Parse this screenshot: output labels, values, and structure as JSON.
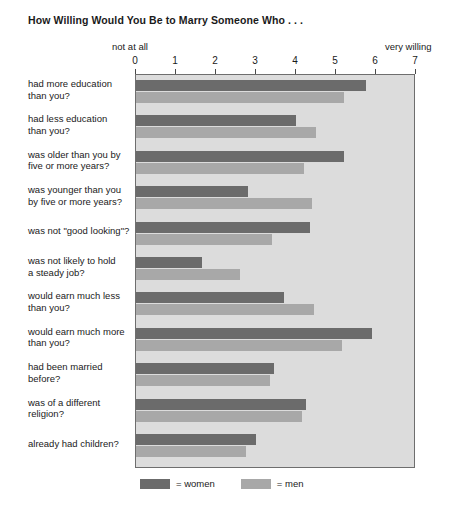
{
  "chart_data": {
    "type": "bar",
    "orientation": "horizontal",
    "title": "How Willing Would You Be to Marry Someone Who . . .",
    "xlabel": "",
    "ylabel": "",
    "xlim": [
      0,
      7
    ],
    "ticks": [
      0,
      1,
      2,
      3,
      4,
      5,
      6,
      7
    ],
    "axis_low_caption": "not at all",
    "axis_high_caption": "very willing",
    "grid": false,
    "legend_position": "bottom",
    "categories": [
      "had more education than you?",
      "had less education than you?",
      "was older than you by five or more years?",
      "was younger than you by five or more years?",
      "was not \"good looking\"?",
      "was not likely to hold a steady job?",
      "would earn much less than you?",
      "would earn much more than you?",
      "had been married before?",
      "was of a different religion?",
      "already had children?"
    ],
    "category_lines": [
      [
        "had more education",
        "than you?"
      ],
      [
        "had less education",
        "than you?"
      ],
      [
        "was older than you by",
        "five or more years?"
      ],
      [
        "was younger than you",
        "by five or more years?"
      ],
      [
        "was not \"good looking\"?"
      ],
      [
        "was not likely to hold",
        "a steady job?"
      ],
      [
        "would earn much less",
        "than you?"
      ],
      [
        "would earn much more",
        "than you?"
      ],
      [
        "had been married",
        "before?"
      ],
      [
        "was of a different",
        "religion?"
      ],
      [
        "already had children?"
      ]
    ],
    "series": [
      {
        "name": "women",
        "color": "#6b6b6b",
        "values": [
          5.75,
          4.0,
          5.2,
          2.8,
          4.35,
          1.65,
          3.7,
          5.9,
          3.45,
          4.25,
          3.0
        ]
      },
      {
        "name": "men",
        "color": "#a8a8a8",
        "values": [
          5.2,
          4.5,
          4.2,
          4.4,
          3.4,
          2.6,
          4.45,
          5.15,
          3.35,
          4.15,
          2.75
        ]
      }
    ],
    "legend": [
      {
        "swatch_color": "#6b6b6b",
        "label": "= women"
      },
      {
        "swatch_color": "#a8a8a8",
        "label": "= men"
      }
    ],
    "plot_background": "#dcdcdc",
    "axis_color": "#6e6e6e"
  }
}
